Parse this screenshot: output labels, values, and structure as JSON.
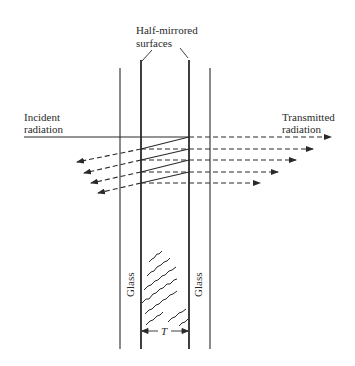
{
  "diagram": {
    "labels": {
      "top_line1": "Half-mirrored",
      "top_line2": "surfaces",
      "incident_line1": "Incident",
      "incident_line2": "radiation",
      "transmitted_line1": "Transmitted",
      "transmitted_line2": "radiation",
      "glass_left": "Glass",
      "glass_right": "Glass",
      "gap_thickness": "T"
    },
    "elements": {
      "outer_glass_left": "thin vertical line",
      "mirror_left": "half-mirrored surface (thick line)",
      "mirror_right": "half-mirrored surface (thick line)",
      "outer_glass_right": "thin vertical line",
      "transmitted_rays": 5,
      "reflected_rays": 4,
      "gap_hatching": "wavy diagonal strokes"
    },
    "colors": {
      "ink": "#2a2a2a",
      "background": "#ffffff"
    }
  }
}
